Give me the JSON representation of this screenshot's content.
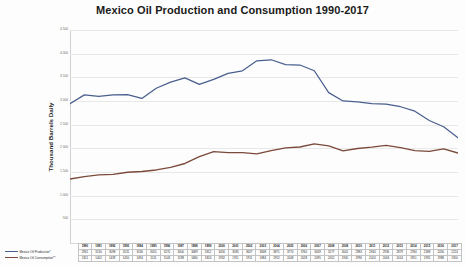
{
  "chart_data": {
    "type": "line",
    "title": "Mexico Oil Production and Consumption 1990-2017",
    "xlabel": "",
    "ylabel": "Thousand Barrels Daily",
    "ylim": [
      0,
      4500
    ],
    "ytick_values": [
      4500,
      4000,
      3500,
      3000,
      2500,
      2000,
      1500,
      1000,
      500
    ],
    "ytick_labels": [
      "4 500",
      "4 000",
      "3 500",
      "3 000",
      "2 500",
      "2 000",
      "1 500",
      "1 000",
      "500"
    ],
    "grid": true,
    "legend_position": "bottom-left-table",
    "categories": [
      "1990",
      "1991",
      "1992",
      "1993",
      "1994",
      "1995",
      "1996",
      "1997",
      "1998",
      "1999",
      "2000",
      "2001",
      "2002",
      "2003",
      "2004",
      "2005",
      "2006",
      "2007",
      "2008",
      "2009",
      "2010",
      "2011",
      "2012",
      "2013",
      "2014",
      "2015",
      "2016",
      "2017"
    ],
    "series": [
      {
        "name": "Mexico Oil Production*",
        "color": "#4a5f8e",
        "values": [
          2941,
          3130,
          3098,
          3131,
          3136,
          3055,
          3270,
          3400,
          3489,
          3352,
          3456,
          3585,
          3637,
          3848,
          3871,
          3770,
          3760,
          3639,
          3177,
          3001,
          2983,
          2944,
          2936,
          2879,
          2784,
          2588,
          2456,
          2224
        ]
      },
      {
        "name": "Mexico Oil Consumption**",
        "color": "#7b4a3a",
        "values": [
          1351,
          1402,
          1439,
          1450,
          1494,
          1511,
          1543,
          1598,
          1680,
          1824,
          1932,
          1911,
          1911,
          1884,
          1952,
          2008,
          2028,
          2095,
          2052,
          1945,
          1996,
          2024,
          2063,
          2014,
          1951,
          1935,
          1988,
          1900
        ]
      }
    ]
  },
  "table": {
    "production_row_label": "Mexico Oil Production*",
    "consumption_row_label": "Mexico Oil Consumption**"
  }
}
